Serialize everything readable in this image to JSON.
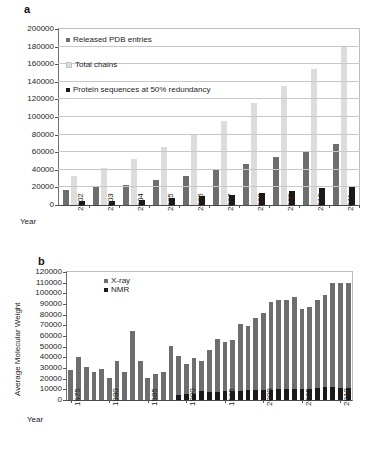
{
  "figure": {
    "panels": [
      {
        "key": "a",
        "label": "a"
      },
      {
        "key": "b",
        "label": "b"
      }
    ]
  },
  "panel_a": {
    "label": "a",
    "x_axis_name": "Year",
    "legend": [
      {
        "name": "released-pdb-entries",
        "label": "Released PDB entries",
        "color": "#6e6e6e"
      },
      {
        "name": "total-chains",
        "label": "Total chains",
        "color": "#dcdcdc"
      },
      {
        "name": "protein-sequences-50",
        "label": "Protein sequences at 50% redundancy",
        "color": "#1a1a1a"
      }
    ],
    "ytick_labels": [
      "200000",
      "180000",
      "160000",
      "140000",
      "120000",
      "100000",
      "80000",
      "60000",
      "40000",
      "20000",
      "0"
    ]
  },
  "panel_b": {
    "label": "b",
    "x_axis_name": "Year",
    "y_axis_label": "Average Molecular Weight",
    "legend": [
      {
        "name": "x-ray",
        "label": "X-ray",
        "color": "#6e6e6e"
      },
      {
        "name": "nmr",
        "label": "NMR",
        "color": "#1a1a1a"
      }
    ],
    "ytick_labels": [
      "120000",
      "110000",
      "100000",
      "90000",
      "80000",
      "70000",
      "60000",
      "50000",
      "40000",
      "30000",
      "20000",
      "10000",
      "0"
    ]
  },
  "chart_data": [
    {
      "type": "bar",
      "panel": "a",
      "title": "",
      "xlabel": "Year",
      "ylabel": "",
      "ylim": [
        0,
        200000
      ],
      "ytick_step": 20000,
      "grid": true,
      "legend_position": "inside-top-left",
      "categories": [
        "2002",
        "2003",
        "2004",
        "2005",
        "2006",
        "2007",
        "2008",
        "2009",
        "2010",
        "2011"
      ],
      "series": [
        {
          "name": "Released PDB entries",
          "color": "#6e6e6e",
          "values": [
            16500,
            20000,
            23000,
            28000,
            33500,
            40000,
            47000,
            54000,
            61000,
            69000
          ]
        },
        {
          "name": "Total chains",
          "color": "#dcdcdc",
          "values": [
            33500,
            42000,
            52000,
            65500,
            80000,
            96000,
            116000,
            135000,
            155000,
            181000
          ]
        },
        {
          "name": "Protein sequences at 50% redundancy",
          "color": "#1a1a1a",
          "values": [
            4500,
            5000,
            6000,
            8000,
            10000,
            11500,
            14000,
            16000,
            19000,
            21000
          ]
        }
      ]
    },
    {
      "type": "bar",
      "panel": "b",
      "title": "",
      "xlabel": "Year",
      "ylabel": "Average Molecular Weight",
      "ylim": [
        0,
        120000
      ],
      "ytick_step": 10000,
      "grid": false,
      "legend_position": "inside-top-left",
      "categories": [
        "1975",
        "1976",
        "1977",
        "1978",
        "1979",
        "1980",
        "1981",
        "1982",
        "1983",
        "1984",
        "1985",
        "1986",
        "1987",
        "1988",
        "1989",
        "1990",
        "1991",
        "1992",
        "1993",
        "1994",
        "1995",
        "1996",
        "1997",
        "1998",
        "1999",
        "2000",
        "2001",
        "2002",
        "2003",
        "2004",
        "2005",
        "2006",
        "2007",
        "2008",
        "2009",
        "2010",
        "2011"
      ],
      "xtick_labels": [
        "1975",
        "1980",
        "1985",
        "1990",
        "1995",
        "2000",
        "2005",
        "2010"
      ],
      "series": [
        {
          "name": "X-ray",
          "color": "#6e6e6e",
          "values": [
            28000,
            40500,
            30500,
            26000,
            29000,
            21000,
            36500,
            26000,
            65000,
            36500,
            21000,
            24500,
            26000,
            50500,
            41000,
            33500,
            39500,
            37000,
            46500,
            57500,
            54500,
            56000,
            71500,
            69000,
            76500,
            82000,
            92000,
            94000,
            93500,
            97000,
            85000,
            87000,
            93500,
            98000,
            110000,
            110000,
            110000
          ]
        },
        {
          "name": "NMR",
          "color": "#1a1a1a",
          "values": [
            0,
            0,
            0,
            0,
            0,
            0,
            0,
            0,
            0,
            0,
            0,
            0,
            0,
            0,
            4800,
            5200,
            5500,
            8200,
            7500,
            7300,
            8800,
            8200,
            8500,
            9200,
            9000,
            9300,
            9500,
            10000,
            10200,
            10500,
            10200,
            10500,
            11000,
            12000,
            12500,
            11500,
            11500
          ]
        }
      ]
    }
  ]
}
